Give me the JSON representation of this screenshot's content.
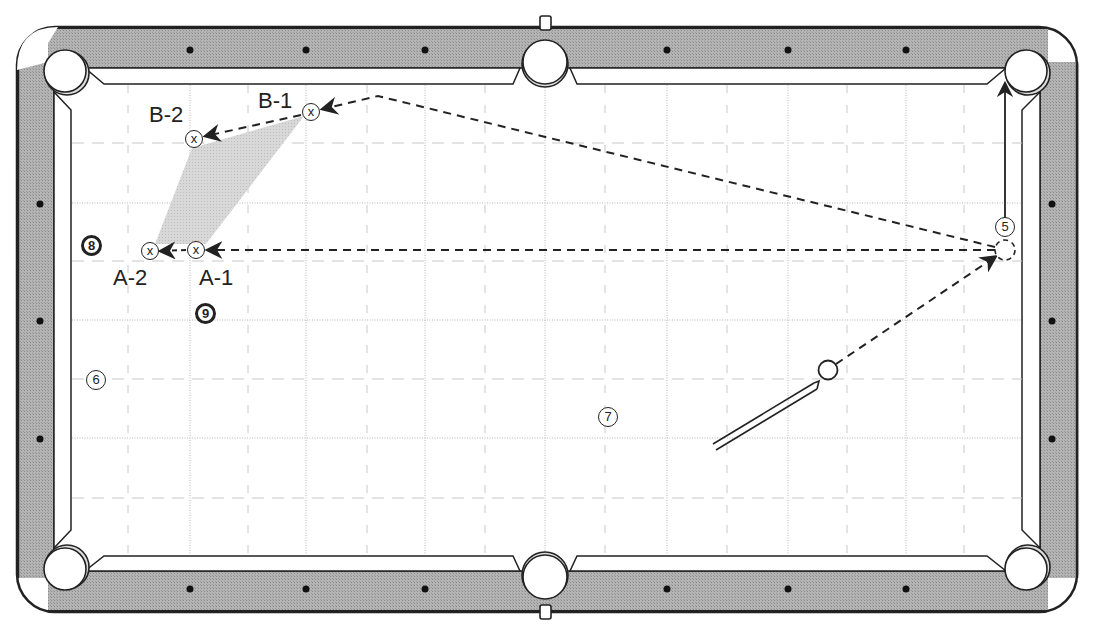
{
  "diagram": {
    "type": "billiards-table-shot-diagram",
    "title_partial": "",
    "colors": {
      "rail": "#a8a8a8",
      "outline": "#222222",
      "grid": "#b0b0b0",
      "shade": "#d2d2d2",
      "felt": "#ffffff"
    },
    "balls": [
      {
        "id": "5",
        "label": "5",
        "style": "outline",
        "x": 1005,
        "y": 228
      },
      {
        "id": "6",
        "label": "6",
        "style": "outline",
        "x": 96,
        "y": 381
      },
      {
        "id": "7",
        "label": "7",
        "style": "outline",
        "x": 608,
        "y": 418
      },
      {
        "id": "8",
        "label": "8",
        "style": "solid",
        "x": 91,
        "y": 245
      },
      {
        "id": "9",
        "label": "9",
        "style": "solid",
        "x": 205,
        "y": 313
      }
    ],
    "cue_ball": {
      "x": 828,
      "y": 370
    },
    "ghost_ball": {
      "x": 1005,
      "y": 250
    },
    "targets": [
      {
        "id": "A-1",
        "label": "A-1",
        "mark": "x",
        "x": 196,
        "y": 250
      },
      {
        "id": "A-2",
        "label": "A-2",
        "mark": "x",
        "x": 150,
        "y": 251
      },
      {
        "id": "B-1",
        "label": "B-1",
        "mark": "x",
        "x": 311,
        "y": 112
      },
      {
        "id": "B-2",
        "label": "B-2",
        "mark": "x",
        "x": 194,
        "y": 139
      }
    ],
    "paths": [
      {
        "name": "cue-to-ghost",
        "style": "dashed",
        "from": [
          836,
          364
        ],
        "to": [
          995,
          255
        ]
      },
      {
        "name": "cue-ball-A-path",
        "style": "dashed",
        "from": [
          995,
          250
        ],
        "to": [
          206,
          250
        ]
      },
      {
        "name": "cue-ball-B-path",
        "style": "dashed",
        "points": [
          [
            995,
            247
          ],
          [
            378,
            96
          ],
          [
            321,
            109
          ]
        ]
      },
      {
        "name": "A1-to-A2",
        "style": "dashed",
        "from": [
          186,
          250
        ],
        "to": [
          160,
          251
        ]
      },
      {
        "name": "B1-to-B2",
        "style": "dashed",
        "from": [
          302,
          115
        ],
        "to": [
          204,
          136
        ]
      },
      {
        "name": "object-ball-to-pocket",
        "style": "solid",
        "from": [
          1005,
          218
        ],
        "to": [
          1005,
          82
        ]
      }
    ],
    "pockets": [
      {
        "name": "top-left",
        "x": 65,
        "y": 71
      },
      {
        "name": "top-center",
        "x": 545,
        "y": 63
      },
      {
        "name": "top-right",
        "x": 1026,
        "y": 71
      },
      {
        "name": "bottom-left",
        "x": 65,
        "y": 569
      },
      {
        "name": "bottom-center",
        "x": 545,
        "y": 577
      },
      {
        "name": "bottom-right",
        "x": 1026,
        "y": 569
      }
    ],
    "diamonds": {
      "top": [
        [
          190,
          50
        ],
        [
          306,
          50
        ],
        [
          425,
          50
        ],
        [
          667,
          50
        ],
        [
          788,
          50
        ],
        [
          906,
          50
        ]
      ],
      "bottom": [
        [
          190,
          589
        ],
        [
          306,
          589
        ],
        [
          425,
          589
        ],
        [
          667,
          589
        ],
        [
          788,
          589
        ],
        [
          906,
          589
        ]
      ],
      "left": [
        [
          40,
          204
        ],
        [
          40,
          321
        ],
        [
          40,
          439
        ]
      ],
      "right": [
        [
          1052,
          204
        ],
        [
          1052,
          321
        ],
        [
          1052,
          439
        ]
      ]
    }
  }
}
